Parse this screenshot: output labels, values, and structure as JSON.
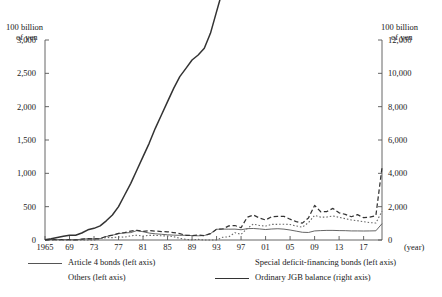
{
  "chart_data": {
    "type": "line",
    "title": "",
    "xlabel": "(year)",
    "ylabel": "100 billion of yen",
    "y2label": "100 billion of yen",
    "grid": false,
    "legend_position": "bottom",
    "axis_left": {
      "label_line1": "100 billion",
      "label_line2": "of yen",
      "ticks": [
        "3,000",
        "2,500",
        "2,000",
        "1,500",
        "1,000",
        "500",
        "0"
      ],
      "values": [
        3000,
        2500,
        2000,
        1500,
        1000,
        500,
        0
      ],
      "ylim": [
        0,
        3000
      ]
    },
    "axis_right": {
      "label_line1": "100 billion",
      "label_line2": "of yen",
      "ticks": [
        "12,000",
        "10,000",
        "8,000",
        "6,000",
        "4,000",
        "2,000",
        "0"
      ],
      "values": [
        12000,
        10000,
        8000,
        6000,
        4000,
        2000,
        0
      ],
      "ylim": [
        0,
        12000
      ]
    },
    "axis_x": {
      "unit": "(year)",
      "tick_labels": [
        "1965",
        "69",
        "73",
        "77",
        "81",
        "85",
        "89",
        "93",
        "97",
        "01",
        "05",
        "09",
        "13",
        "17"
      ],
      "tick_years": [
        1965,
        1969,
        1973,
        1977,
        1981,
        1985,
        1989,
        1993,
        1997,
        2001,
        2005,
        2009,
        2013,
        2017
      ],
      "xlim": [
        1965,
        2020
      ]
    },
    "x": [
      1965,
      1966,
      1967,
      1968,
      1969,
      1970,
      1971,
      1972,
      1973,
      1974,
      1975,
      1976,
      1977,
      1978,
      1979,
      1980,
      1981,
      1982,
      1983,
      1984,
      1985,
      1986,
      1987,
      1988,
      1989,
      1990,
      1991,
      1992,
      1993,
      1994,
      1995,
      1996,
      1997,
      1998,
      1999,
      2000,
      2001,
      2002,
      2003,
      2004,
      2005,
      2006,
      2007,
      2008,
      2009,
      2010,
      2011,
      2012,
      2013,
      2014,
      2015,
      2016,
      2017,
      2018,
      2019,
      2020
    ],
    "series": [
      {
        "name": "Article 4 bonds (left axis)",
        "axis": "left",
        "style": "solid-thin",
        "color": "#555555",
        "values": [
          2,
          7,
          7,
          5,
          5,
          3,
          12,
          19,
          17,
          21,
          52,
          72,
          95,
          107,
          111,
          141,
          124,
          104,
          93,
          86,
          78,
          73,
          70,
          71,
          66,
          63,
          67,
          95,
          161,
          164,
          162,
          163,
          154,
          170,
          173,
          166,
          157,
          165,
          169,
          163,
          150,
          133,
          116,
          113,
          136,
          141,
          144,
          144,
          141,
          140,
          136,
          136,
          135,
          136,
          138,
          245
        ]
      },
      {
        "name": "Others (left axis)",
        "axis": "left",
        "style": "dashed",
        "color": "#333333",
        "values": [
          2,
          7,
          7,
          5,
          5,
          3,
          12,
          19,
          18,
          22,
          55,
          72,
          100,
          112,
          134,
          145,
          129,
          140,
          134,
          127,
          123,
          112,
          94,
          71,
          66,
          73,
          67,
          95,
          161,
          165,
          212,
          217,
          184,
          340,
          375,
          330,
          300,
          350,
          354,
          354,
          312,
          275,
          253,
          331,
          519,
          423,
          427,
          474,
          408,
          385,
          349,
          380,
          335,
          344,
          365,
          1086
        ]
      },
      {
        "name": "Special deficit-financing bonds (left axis)",
        "axis": "left",
        "style": "dotted",
        "color": "#666666",
        "values": [
          0,
          0,
          0,
          0,
          0,
          0,
          0,
          0,
          0,
          21,
          37,
          35,
          45,
          43,
          63,
          72,
          58,
          70,
          69,
          63,
          60,
          50,
          25,
          9,
          2,
          9,
          0,
          0,
          0,
          41,
          48,
          110,
          85,
          171,
          240,
          218,
          209,
          235,
          235,
          237,
          232,
          210,
          193,
          261,
          369,
          343,
          344,
          360,
          340,
          319,
          300,
          290,
          275,
          260,
          255,
          430
        ]
      },
      {
        "name": "Ordinary JGB balance (right axis)",
        "axis": "right",
        "style": "solid-thick",
        "color": "#333333",
        "values": [
          20,
          70,
          150,
          220,
          280,
          290,
          420,
          610,
          700,
          850,
          1150,
          1500,
          2000,
          2700,
          3400,
          4200,
          5000,
          5800,
          6700,
          7500,
          8300,
          9100,
          9800,
          10300,
          10800,
          11100,
          11500,
          12400,
          13700,
          15000,
          16800,
          19200,
          21800,
          29500,
          33100,
          36800,
          39200,
          42100,
          45700,
          49900,
          52700,
          53200,
          54100,
          56500,
          62200,
          63600,
          66900,
          70500,
          74500,
          77400,
          80500,
          83000,
          85300,
          87400,
          88700,
          106800
        ]
      }
    ],
    "legend": [
      {
        "label": "Article 4 bonds (left axis)",
        "style": "solid-thin"
      },
      {
        "label": "Others (left axis)",
        "style": "dashed"
      },
      {
        "label": "Special deficit-financing bonds (left axis)",
        "style": "dotted"
      },
      {
        "label": "Ordinary JGB balance (right axis)",
        "style": "solid-thick"
      }
    ]
  }
}
